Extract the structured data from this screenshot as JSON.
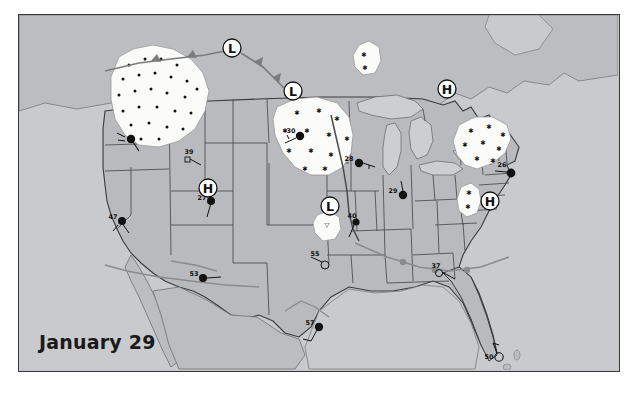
{
  "figure": {
    "kind": "surface-weather-map",
    "date_label": "January 29",
    "region": "United States"
  },
  "colors": {
    "land": "#b9babd",
    "land_alt": "#c3c4c6",
    "water": "#cdced1",
    "ocean": "#c9cacd",
    "precip_fill": "#fbfbfa",
    "border_line": "#3a3a3a",
    "state_line": "#4a4a4a",
    "front_line": "#555555",
    "symbol": "#111111",
    "frame": "#3a3a3a"
  },
  "pressure_centers": [
    {
      "type": "L",
      "label": "L",
      "x": 213,
      "y": 33,
      "name": "low-pressure-pacific-northwest"
    },
    {
      "type": "L",
      "label": "L",
      "x": 274,
      "y": 76,
      "name": "low-pressure-northern-plains"
    },
    {
      "type": "H",
      "label": "H",
      "x": 189,
      "y": 173,
      "name": "high-pressure-great-basin"
    },
    {
      "type": "L",
      "label": "L",
      "x": 311,
      "y": 191,
      "name": "low-pressure-central-plains"
    },
    {
      "type": "H",
      "label": "H",
      "x": 428,
      "y": 74,
      "name": "high-pressure-quebec"
    },
    {
      "type": "H",
      "label": "H",
      "x": 471,
      "y": 186,
      "name": "high-pressure-mid-atlantic"
    }
  ],
  "stations": [
    {
      "temp": "39",
      "x": 170,
      "y": 140,
      "name": "station-idaho"
    },
    {
      "temp": "27",
      "x": 185,
      "y": 184,
      "name": "station-utah"
    },
    {
      "temp": "47",
      "x": 96,
      "y": 205,
      "name": "station-northern-california"
    },
    {
      "temp": "53",
      "x": 175,
      "y": 263,
      "name": "station-southern-arizona"
    },
    {
      "temp": "30",
      "x": 274,
      "y": 120,
      "name": "station-north-dakota"
    },
    {
      "temp": "28",
      "x": 333,
      "y": 148,
      "name": "station-minnesota"
    },
    {
      "temp": "29",
      "x": 377,
      "y": 180,
      "name": "station-wisconsin"
    },
    {
      "temp": "40",
      "x": 334,
      "y": 205,
      "name": "station-kansas"
    },
    {
      "temp": "55",
      "x": 298,
      "y": 248,
      "name": "station-oklahoma"
    },
    {
      "temp": "57",
      "x": 293,
      "y": 311,
      "name": "station-texas"
    },
    {
      "temp": "37",
      "x": 418,
      "y": 255,
      "name": "station-georgia"
    },
    {
      "temp": "50",
      "x": 476,
      "y": 341,
      "name": "station-florida"
    },
    {
      "temp": "26",
      "x": 486,
      "y": 157,
      "name": "station-new-england"
    },
    {
      "temp": "115",
      "x": 120,
      "y": 121,
      "name": "station-oregon-coast"
    }
  ],
  "precip_areas": [
    {
      "name": "precip-pacific-northwest",
      "kind": "rain-dots"
    },
    {
      "name": "precip-canada-patch",
      "kind": "snow-stars"
    },
    {
      "name": "precip-northern-plains",
      "kind": "snow-stars"
    },
    {
      "name": "precip-northeast",
      "kind": "snow-stars"
    },
    {
      "name": "precip-appalachians",
      "kind": "snow-stars"
    },
    {
      "name": "precip-central-plains",
      "kind": "snow-stars"
    }
  ],
  "fronts": [
    {
      "name": "front-cold-northwest",
      "kind": "cold"
    },
    {
      "name": "front-cold-plains",
      "kind": "cold"
    },
    {
      "name": "front-warm-south",
      "kind": "warm"
    }
  ]
}
